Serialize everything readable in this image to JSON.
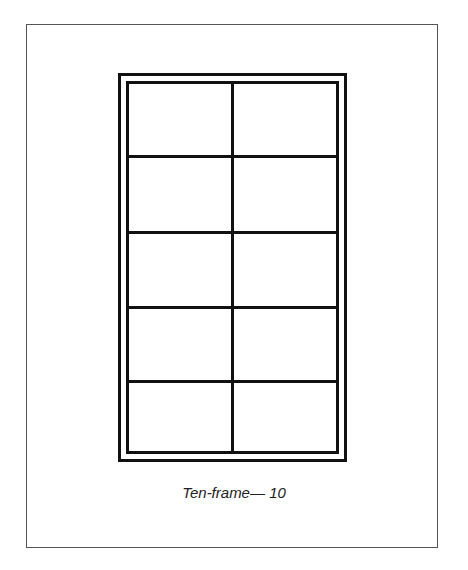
{
  "diagram": {
    "type": "ten-frame",
    "rows": 5,
    "columns": 2,
    "cells_total": 10,
    "filled_cells": 0,
    "caption": "Ten-frame— 10",
    "line_color": "#111111",
    "border_color": "#555555"
  }
}
